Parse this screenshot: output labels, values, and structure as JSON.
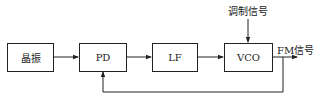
{
  "diagram": {
    "blocks": [
      {
        "id": "crystal",
        "label": "晶振"
      },
      {
        "id": "pd",
        "label": "PD"
      },
      {
        "id": "lf",
        "label": "LF"
      },
      {
        "id": "vco",
        "label": "VCO"
      }
    ],
    "inputs": {
      "modulation_label": "调制信号"
    },
    "outputs": {
      "fm_label": "FM信号"
    },
    "edges": [
      {
        "from": "晶振",
        "to": "PD"
      },
      {
        "from": "PD",
        "to": "LF"
      },
      {
        "from": "LF",
        "to": "VCO"
      },
      {
        "from": "调制信号",
        "to": "VCO"
      },
      {
        "from": "VCO",
        "to": "FM信号"
      },
      {
        "from": "VCO output",
        "to": "PD",
        "type": "feedback"
      }
    ]
  }
}
